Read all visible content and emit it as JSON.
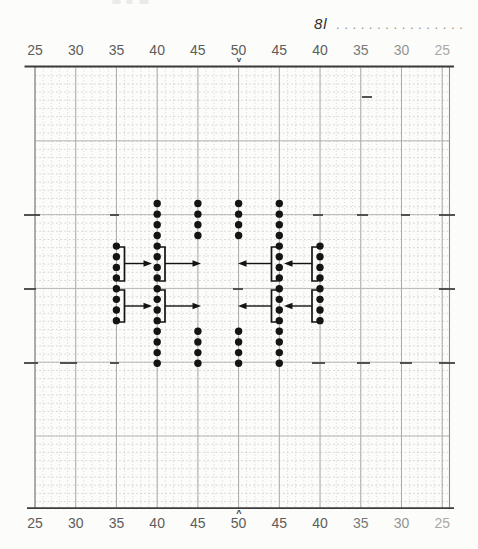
{
  "header": {
    "annotation": "8l",
    "leader_dots": "................"
  },
  "axis": {
    "top_labels": [
      "25",
      "30",
      "35",
      "40",
      "45",
      "50",
      "45",
      "40",
      "35",
      "30",
      "25"
    ],
    "bottom_labels": [
      "25",
      "30",
      "35",
      "40",
      "45",
      "50",
      "45",
      "40",
      "35",
      "30",
      "25"
    ],
    "center_marker_top": "v",
    "center_marker_bottom": "^",
    "center_axis_value": "50"
  },
  "colors": {
    "background": "#fcfcfb",
    "grid_light": "#c6c6c4",
    "grid_heavy_vertical": "#a2a2a0",
    "grid_heavy_horizontal": "#b0b0ae",
    "grid_border": "#8e8e8c",
    "axis_line": "#3c3c3a",
    "label": "#5c5c5a",
    "dash": "#4a4a48",
    "dot": "#141414"
  },
  "chart_data": {
    "type": "scatter",
    "title": "",
    "xlabel": "",
    "ylabel": "",
    "x_axis_values": [
      25,
      30,
      35,
      40,
      45,
      50,
      45,
      40,
      35,
      30,
      25
    ],
    "row_count": 16,
    "row0_y_px": 203.5,
    "row_spacing_px": 10.65,
    "dot_columns": [
      {
        "axis_label": "35",
        "side": "left",
        "x_px": 116.4,
        "row_ranges": [
          [
            4,
            11
          ]
        ]
      },
      {
        "axis_label": "40",
        "side": "left",
        "x_px": 157.2,
        "row_ranges": [
          [
            0,
            15
          ]
        ]
      },
      {
        "axis_label": "45",
        "side": "left",
        "x_px": 197.9,
        "row_ranges": [
          [
            0,
            3
          ],
          [
            12,
            15
          ]
        ]
      },
      {
        "axis_label": "50",
        "side": "center",
        "x_px": 238.6,
        "row_ranges": [
          [
            0,
            3
          ],
          [
            12,
            15
          ]
        ]
      },
      {
        "axis_label": "45",
        "side": "right",
        "x_px": 279.3,
        "row_ranges": [
          [
            0,
            15
          ]
        ]
      },
      {
        "axis_label": "40",
        "side": "right",
        "x_px": 320.0,
        "row_ranges": [
          [
            4,
            11
          ]
        ]
      }
    ],
    "brackets": [
      {
        "x_px": 124.5,
        "tick_to_x": 118.5,
        "y_top": 247,
        "y_bottom": 281
      },
      {
        "x_px": 124.5,
        "tick_to_x": 118.5,
        "y_top": 290,
        "y_bottom": 322
      },
      {
        "x_px": 165.0,
        "tick_to_x": 159.0,
        "y_top": 247,
        "y_bottom": 281
      },
      {
        "x_px": 165.0,
        "tick_to_x": 159.0,
        "y_top": 290,
        "y_bottom": 322
      },
      {
        "x_px": 271.5,
        "tick_to_x": 277.5,
        "y_top": 247,
        "y_bottom": 281
      },
      {
        "x_px": 271.5,
        "tick_to_x": 277.5,
        "y_top": 290,
        "y_bottom": 322
      },
      {
        "x_px": 312.0,
        "tick_to_x": 318.0,
        "y_top": 247,
        "y_bottom": 281
      },
      {
        "x_px": 312.0,
        "tick_to_x": 318.0,
        "y_top": 290,
        "y_bottom": 322
      }
    ],
    "arrows": [
      {
        "y_px": 263.5,
        "x_from": 124.5,
        "x_to": 148.5
      },
      {
        "y_px": 263.5,
        "x_from": 165.0,
        "x_to": 197.5
      },
      {
        "y_px": 263.5,
        "x_from": 271.5,
        "x_to": 241.5
      },
      {
        "y_px": 263.5,
        "x_from": 312.0,
        "x_to": 287.5
      },
      {
        "y_px": 306.0,
        "x_from": 124.5,
        "x_to": 148.5
      },
      {
        "y_px": 306.0,
        "x_from": 165.0,
        "x_to": 197.5
      },
      {
        "y_px": 306.0,
        "x_from": 271.5,
        "x_to": 241.5
      },
      {
        "y_px": 306.0,
        "x_from": 312.0,
        "x_to": 287.5
      }
    ],
    "reference_dashes": [
      {
        "y_px": 97,
        "segments": [
          [
            362,
            372
          ]
        ]
      },
      {
        "y_px": 215,
        "segments": [
          [
            24,
            40
          ],
          [
            110,
            119
          ],
          [
            313,
            323
          ],
          [
            357,
            368
          ],
          [
            401,
            410
          ],
          [
            439,
            455
          ]
        ]
      },
      {
        "y_px": 289,
        "segments": [
          [
            24,
            36
          ],
          [
            233,
            243
          ],
          [
            439,
            455
          ]
        ]
      },
      {
        "y_px": 363,
        "segments": [
          [
            24,
            38
          ],
          [
            60,
            77
          ],
          [
            110,
            119
          ],
          [
            312,
            325
          ],
          [
            357,
            370
          ],
          [
            400,
            412
          ],
          [
            439,
            455
          ]
        ]
      }
    ]
  }
}
